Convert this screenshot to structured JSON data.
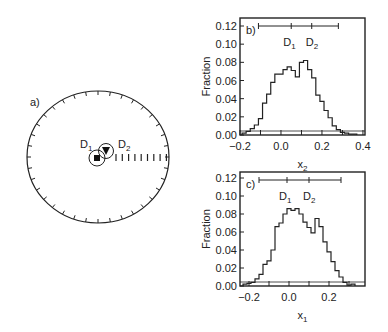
{
  "chart_data": [
    {
      "panel": "a)",
      "type": "polar-diagram",
      "labels": [
        "D1",
        "D2"
      ],
      "markers": [
        {
          "name": "D1",
          "shape": "square"
        },
        {
          "name": "D2",
          "shape": "triangle-down"
        }
      ],
      "tick_count": 36
    },
    {
      "panel": "b)",
      "type": "histogram",
      "xlabel": "x2",
      "ylabel": "Fraction",
      "xlim": [
        -0.2,
        0.41
      ],
      "ylim": [
        0,
        0.12
      ],
      "xticks": [
        "-0.2",
        "0.0",
        "0.2",
        "0.4"
      ],
      "yticks": [
        "0.00",
        "0.02",
        "0.04",
        "0.06",
        "0.08",
        "0.10",
        "0.12"
      ],
      "bin_width": 0.02,
      "bin_start": -0.18,
      "values": [
        0.002,
        0.004,
        0.007,
        0.011,
        0.018,
        0.035,
        0.045,
        0.058,
        0.067,
        0.067,
        0.072,
        0.075,
        0.071,
        0.064,
        0.08,
        0.082,
        0.072,
        0.063,
        0.044,
        0.037,
        0.027,
        0.019,
        0.01,
        0.006,
        0.003,
        0.002,
        0.001,
        0.001
      ],
      "range_bar": {
        "x_start": -0.11,
        "x_end": 0.28,
        "ticks": [
          0.05,
          0.15
        ]
      },
      "range_labels": [
        "D1",
        "D2"
      ]
    },
    {
      "panel": "c)",
      "type": "histogram",
      "xlabel": "x1",
      "ylabel": "Fraction",
      "xlim": [
        -0.245,
        0.38
      ],
      "ylim": [
        0,
        0.12
      ],
      "xticks": [
        "-0.2",
        "0.0",
        "0.2"
      ],
      "yticks": [
        "0.00",
        "0.02",
        "0.04",
        "0.06",
        "0.08",
        "0.10",
        "0.12"
      ],
      "bin_width": 0.02,
      "bin_start": -0.22,
      "values": [
        0.002,
        0.003,
        0.004,
        0.008,
        0.013,
        0.024,
        0.028,
        0.04,
        0.066,
        0.07,
        0.08,
        0.086,
        0.084,
        0.086,
        0.08,
        0.071,
        0.065,
        0.059,
        0.075,
        0.066,
        0.049,
        0.038,
        0.027,
        0.017,
        0.01,
        0.004,
        0.001,
        0.002
      ],
      "range_bar": {
        "x_start": -0.15,
        "x_end": 0.26,
        "ticks": [
          -0.01,
          0.1
        ]
      },
      "range_labels": [
        "D1",
        "D2"
      ]
    }
  ]
}
